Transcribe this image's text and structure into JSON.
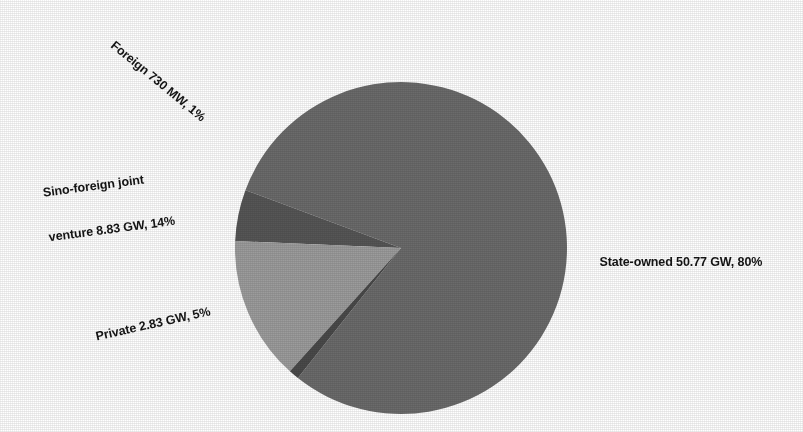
{
  "chart_data": {
    "type": "pie",
    "title": "",
    "subtitle": "",
    "xlabel": "",
    "ylabel": "",
    "legend_position": "none",
    "grid": false,
    "unit_note": "Installed capacity by ownership",
    "categories": [
      "State-owned",
      "Sino-foreign joint venture",
      "Private",
      "Foreign"
    ],
    "values": [
      80,
      14,
      5,
      1
    ],
    "raw_values": [
      50.77,
      8.83,
      2.83,
      0.73
    ],
    "raw_units": [
      "GW",
      "GW",
      "GW",
      "MW"
    ],
    "slices": [
      {
        "name": "State-owned",
        "value_text": "50.77 GW",
        "percent_text": "80%",
        "percent": 80,
        "color": "#6b6b6b",
        "label": "State-owned 50.77 GW, 80%"
      },
      {
        "name": "Foreign",
        "value_text": "730 MW",
        "percent_text": "1%",
        "percent": 1,
        "color": "#4a4a4a",
        "label": "Foreign 730 MW, 1%"
      },
      {
        "name": "Sino-foreign joint venture",
        "value_text": "8.83 GW",
        "percent_text": "14%",
        "percent": 14,
        "color": "#9c9c9c",
        "label_line1": "Sino-foreign joint",
        "label_line2": "venture 8.83 GW, 14%",
        "label": "Sino-foreign joint venture 8.83 GW, 14%"
      },
      {
        "name": "Private",
        "value_text": "2.83 GW",
        "percent_text": "5%",
        "percent": 5,
        "color": "#565656",
        "label": "Private 2.83 GW, 5%"
      }
    ],
    "background_color": "#ffffff",
    "label_color": "#151515"
  },
  "labels": {
    "foreign": "Foreign 730 MW, 1%",
    "sino_line1": "Sino-foreign joint",
    "sino_line2": "venture 8.83 GW, 14%",
    "private": "Private 2.83 GW, 5%",
    "state_owned": "State-owned 50.77 GW, 80%"
  }
}
